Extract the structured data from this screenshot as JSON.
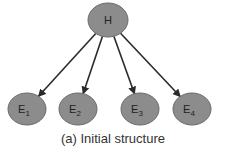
{
  "diagram": {
    "node_fill": "#8c8c8c",
    "node_stroke": "#6a6a6a",
    "edge_color": "#2a2a2a",
    "root": {
      "id": "H",
      "label": "H",
      "cx": 108,
      "cy": 20
    },
    "children": [
      {
        "id": "E1",
        "label": "E",
        "sub": "1",
        "cx": 27,
        "cy": 109
      },
      {
        "id": "E2",
        "label": "E",
        "sub": "2",
        "cx": 78,
        "cy": 109
      },
      {
        "id": "E3",
        "label": "E",
        "sub": "3",
        "cx": 140,
        "cy": 109
      },
      {
        "id": "E4",
        "label": "E",
        "sub": "4",
        "cx": 192,
        "cy": 109
      }
    ],
    "edges": [
      {
        "from": "H",
        "to": "E1"
      },
      {
        "from": "H",
        "to": "E2"
      },
      {
        "from": "H",
        "to": "E3"
      },
      {
        "from": "H",
        "to": "E4"
      }
    ],
    "caption": "(a) Initial structure"
  }
}
